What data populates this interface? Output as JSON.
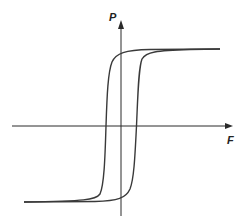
{
  "diagram": {
    "type": "hysteresis-loop",
    "axes": {
      "y_label": "P",
      "x_label": "F"
    },
    "colors": {
      "axis": "#2a2a2a",
      "curve": "#3a3a3a",
      "background": "#ffffff"
    }
  }
}
